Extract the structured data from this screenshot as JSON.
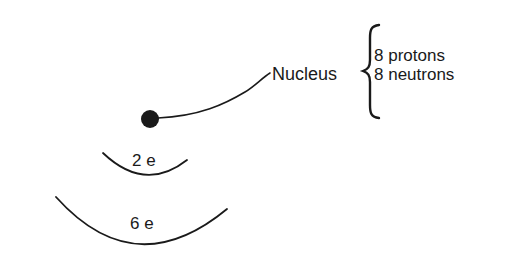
{
  "diagram": {
    "nucleus": {
      "label": "Nucleus",
      "composition": [
        {
          "text": "8 protons"
        },
        {
          "text": "8 neutrons"
        }
      ]
    },
    "shells": [
      {
        "label": "2 e"
      },
      {
        "label": "6 e"
      }
    ],
    "colors": {
      "ink": "#1a1a1a",
      "background": "#ffffff"
    }
  }
}
